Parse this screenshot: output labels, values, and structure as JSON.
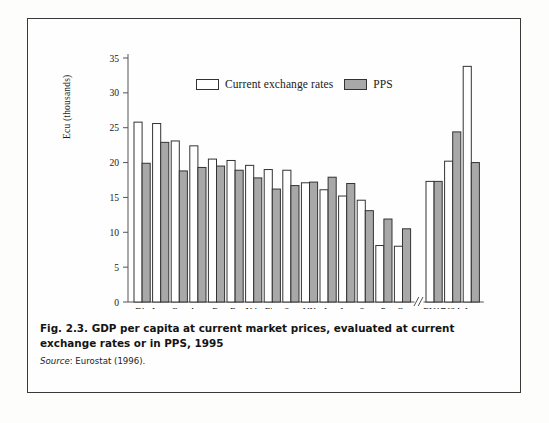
{
  "figure": {
    "caption_number": "Fig. 2.3.",
    "caption_text": "GDP per capita at current market prices, evaluated at current exchange rates or in PPS, 1995",
    "source_word": "Source",
    "source_text": ": Eurostat (1996)."
  },
  "colors": {
    "current_exchange_rates": "#ffffff",
    "pps": "#a8a8a8",
    "bar_outline": "#333333",
    "axis": "#555555",
    "frame": "#3a3a3a"
  },
  "legend": {
    "items": [
      {
        "label": "Current exchange rates",
        "swatch": "current"
      },
      {
        "label": "PPS",
        "swatch": "pps"
      }
    ]
  },
  "axis_break": {
    "symbol": "//",
    "present": true
  },
  "chart_data": {
    "type": "bar",
    "title": "GDP per capita at current market prices, evaluated at current exchange rates or in PPS, 1995",
    "xlabel": "",
    "ylabel": "Ecu (thousands)",
    "ylim": [
      0,
      35
    ],
    "yticks": [
      0,
      5,
      10,
      15,
      20,
      25,
      30,
      35
    ],
    "ytick_labels": [
      "0",
      "5",
      "10",
      "15",
      "20",
      "25",
      "30",
      "35"
    ],
    "grid": false,
    "legend_position": "top-center",
    "categories": [
      "Dk.",
      "Lux.",
      "Ger.",
      "Aus.",
      "B.",
      "Fr.",
      "Nth.",
      "Fin.",
      "Sw.",
      "UK",
      "It.",
      "Ire.",
      "Sp.",
      "P.",
      "Gr.",
      "EU15",
      "USA",
      "Jap."
    ],
    "break_after_index": 14,
    "series": [
      {
        "name": "Current exchange rates",
        "values": [
          25.8,
          25.6,
          23.1,
          22.4,
          20.5,
          20.3,
          19.6,
          19.0,
          18.9,
          17.1,
          16.1,
          15.2,
          14.6,
          8.1,
          8.0,
          17.3,
          20.2,
          33.8
        ]
      },
      {
        "name": "PPS",
        "values": [
          19.9,
          22.9,
          18.8,
          19.3,
          19.5,
          18.9,
          17.8,
          16.2,
          16.7,
          17.2,
          17.9,
          17.0,
          13.1,
          11.9,
          10.5,
          17.3,
          24.4,
          20.0
        ]
      }
    ]
  }
}
